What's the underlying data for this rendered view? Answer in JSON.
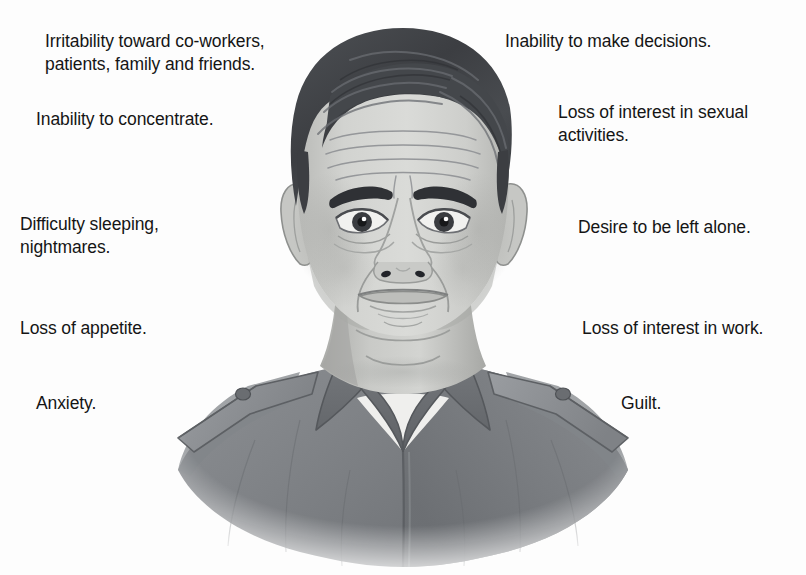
{
  "figure": {
    "background_color": "#fdfdfd",
    "text_color": "#151515",
    "width": 806,
    "height": 575
  },
  "illustration": {
    "name": "distressed-man-bust-illustration",
    "description": "Grayscale line-and-tone drawing of a middle-aged man from the chest up, facing forward with a worried, downcast expression. He has dark side-parted hair, heavy downturned eyebrows, forehead wrinkles, bags under the eyes, deep nasolabial folds and a frowning mouth. He wears a dark gray uniform shirt with a pointed collar, epaulettes with buttons on each shoulder, and a white undershirt visible at the open neck. The figure fades softly into the white background at the bottom.",
    "palette": {
      "hair_dark": "#3f4145",
      "hair_mid": "#55585d",
      "skin_light": "#d6d7d4",
      "skin_mid": "#c2c3c0",
      "skin_shadow": "#a9aaa7",
      "line": "#6e7075",
      "shirt_dark": "#6d7074",
      "shirt_mid": "#808387",
      "shirt_light": "#93969a",
      "undershirt": "#efefed",
      "eye_white": "#f2f2f0",
      "eye_iris": "#3a3c40"
    }
  },
  "labels_left": [
    {
      "id": "irritability",
      "text": "Irritability toward co-workers,\npatients, family and friends.",
      "x": 45,
      "y": 30
    },
    {
      "id": "inability-to-concentrate",
      "text": "Inability to concentrate.",
      "x": 36,
      "y": 108
    },
    {
      "id": "difficulty-sleeping",
      "text": "Difficulty sleeping,\nnightmares.",
      "x": 20,
      "y": 213
    },
    {
      "id": "loss-of-appetite",
      "text": "Loss of appetite.",
      "x": 20,
      "y": 317
    },
    {
      "id": "anxiety",
      "text": "Anxiety.",
      "x": 36,
      "y": 392
    }
  ],
  "labels_right": [
    {
      "id": "inability-to-make-decisions",
      "text": "Inability to make decisions.",
      "x": 505,
      "y": 30
    },
    {
      "id": "loss-of-interest-in-sexual-activities",
      "text": "Loss of interest in sexual\nactivities.",
      "x": 558,
      "y": 101
    },
    {
      "id": "desire-to-be-left-alone",
      "text": "Desire to be left alone.",
      "x": 578,
      "y": 216
    },
    {
      "id": "loss-of-interest-in-work",
      "text": "Loss of interest in work.",
      "x": 582,
      "y": 317
    },
    {
      "id": "guilt",
      "text": "Guilt.",
      "x": 621,
      "y": 392
    }
  ]
}
